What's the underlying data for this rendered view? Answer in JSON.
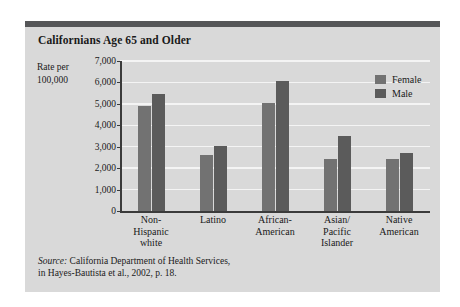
{
  "card": {
    "title": "Californians Age 65 and Older",
    "accent_color": "#555658",
    "background_color": "#d9d9d9"
  },
  "axis_caption": {
    "line1": "Rate per",
    "line2": "100,000"
  },
  "legend": {
    "items": [
      {
        "label": "Female",
        "color": "#727272"
      },
      {
        "label": "Male",
        "color": "#5b5b5b"
      }
    ]
  },
  "source": {
    "prefix": "Source:",
    "line1": " California Department of Health Services,",
    "line2": "in Hayes-Bautista et al., 2002, p. 18."
  },
  "chart_data": {
    "type": "bar",
    "title": "Californians Age 65 and Older",
    "xlabel": "",
    "ylabel": "Rate per 100,000",
    "ylim": [
      0,
      7000
    ],
    "ytick_labels": [
      "7,000",
      "6,000",
      "5,000",
      "4,000",
      "3,000",
      "2,000",
      "1,000",
      "0"
    ],
    "ytick_values": [
      7000,
      6000,
      5000,
      4000,
      3000,
      2000,
      1000,
      0
    ],
    "grid": true,
    "legend_position": "top-right",
    "categories": [
      "Non-\nHispanic\nwhite",
      "Latino",
      "African-\nAmerican",
      "Asian/\nPacific\nIslander",
      "Native\nAmerican"
    ],
    "series": [
      {
        "name": "Female",
        "color": "#727272",
        "values": [
          4900,
          2600,
          5050,
          2450,
          2450
        ]
      },
      {
        "name": "Male",
        "color": "#5b5b5b",
        "values": [
          5450,
          3050,
          6050,
          3480,
          2700
        ]
      }
    ]
  }
}
